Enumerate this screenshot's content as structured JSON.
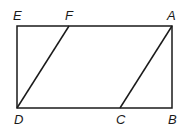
{
  "diagram": {
    "type": "geometry",
    "points": {
      "E": {
        "x": 17,
        "y": 26
      },
      "F": {
        "x": 69,
        "y": 26
      },
      "A": {
        "x": 172,
        "y": 26
      },
      "D": {
        "x": 17,
        "y": 108
      },
      "C": {
        "x": 120,
        "y": 108
      },
      "B": {
        "x": 172,
        "y": 108
      }
    },
    "labels": {
      "E": "E",
      "F": "F",
      "A": "A",
      "D": "D",
      "C": "C",
      "B": "B"
    },
    "segments": [
      [
        "E",
        "A"
      ],
      [
        "A",
        "B"
      ],
      [
        "B",
        "D"
      ],
      [
        "D",
        "E"
      ],
      [
        "D",
        "F"
      ],
      [
        "C",
        "A"
      ]
    ],
    "stroke_color": "#1a1a1a"
  }
}
